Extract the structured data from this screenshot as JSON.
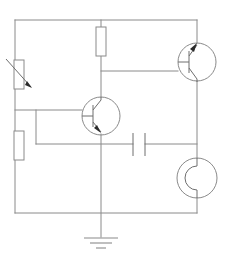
{
  "diagram": {
    "type": "electronic-schematic",
    "background_color": "#ffffff",
    "wire_color": "#8a8a8a",
    "component_color": "#6e6e6e",
    "arrow_color": "#2b2b2b",
    "width": 227,
    "height": 263
  },
  "components": [
    {
      "id": "variable-resistor",
      "name": "Variable resistor",
      "symbol": "resistor-variable",
      "orientation": "vertical",
      "body": {
        "x": 14,
        "y": 60,
        "width": 10,
        "height": 29
      },
      "arrow": {
        "x1": 6,
        "y1": 59,
        "x2": 33,
        "y2": 89
      }
    },
    {
      "id": "resistor-lower-left",
      "name": "Lower left resistor",
      "symbol": "resistor",
      "orientation": "vertical",
      "body": {
        "x": 14,
        "y": 131,
        "width": 10,
        "height": 29
      }
    },
    {
      "id": "resistor-top-middle",
      "name": "Top middle resistor",
      "symbol": "resistor",
      "orientation": "vertical",
      "body": {
        "x": 98,
        "y": 27,
        "width": 10,
        "height": 29
      }
    },
    {
      "id": "transistor-middle",
      "name": "Middle NPN transistor",
      "symbol": "transistor-npn",
      "center": {
        "x": 101,
        "y": 116
      },
      "radius": 19,
      "base_side": "left",
      "collector": "top",
      "emitter": "bottom"
    },
    {
      "id": "transistor-top-right",
      "name": "Top right NPN transistor",
      "symbol": "transistor-npn",
      "center": {
        "x": 197,
        "y": 62
      },
      "radius": 19,
      "base_side": "left",
      "collector": "bottom",
      "emitter": "top"
    },
    {
      "id": "capacitor",
      "name": "Capacitor",
      "symbol": "capacitor-nonpolarized",
      "orientation": "vertical-plates",
      "plate_left_x": 133,
      "plate_right_x": 145,
      "plate_top_y": 133,
      "plate_bottom_y": 156,
      "lead_y": 144
    },
    {
      "id": "circle-device-bottom-right",
      "name": "Bottom right circular device",
      "symbol": "round-device-with-inner-arc",
      "center": {
        "x": 197,
        "y": 178
      },
      "radius": 20
    },
    {
      "id": "ground",
      "name": "Ground",
      "symbol": "ground-earth",
      "stem": {
        "x": 101,
        "y_top": 134,
        "y_bottom": 237
      },
      "bars": [
        {
          "half_width": 17,
          "y": 238
        },
        {
          "half_width": 11,
          "y": 243
        },
        {
          "half_width": 5,
          "y": 248
        }
      ]
    }
  ],
  "nodes": {
    "top_rail_y": 20,
    "bottom_rail_y": 213,
    "left_rail_x": 15,
    "right_rail_x": 197,
    "mid_rail_x": 101,
    "base_wire_y": 110,
    "cap_wire_y": 144,
    "upper_branch_y": 71,
    "branch_x": 36
  },
  "labels": {
    "none_visible": ""
  }
}
